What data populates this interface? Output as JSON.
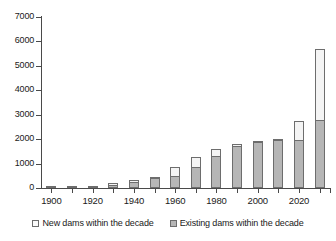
{
  "chart_data": {
    "type": "bar",
    "stacked": true,
    "title": "",
    "xlabel": "",
    "ylabel": "",
    "ylim": [
      0,
      7000
    ],
    "ytick_step": 1000,
    "yticks": [
      0,
      1000,
      2000,
      3000,
      4000,
      5000,
      6000,
      7000
    ],
    "grid": false,
    "legend_position": "bottom",
    "categories": [
      1900,
      1910,
      1920,
      1930,
      1940,
      1950,
      1960,
      1970,
      1980,
      1990,
      2000,
      2010,
      2020,
      2030
    ],
    "xtick_labels": [
      "1900",
      "",
      "1920",
      "",
      "1940",
      "",
      "1960",
      "",
      "1980",
      "",
      "2000",
      "",
      "2020",
      ""
    ],
    "series": [
      {
        "name": "Existing dams within the decade",
        "color": "#b6b6b6",
        "values": [
          10,
          15,
          40,
          120,
          230,
          390,
          500,
          880,
          1310,
          1700,
          1880,
          1970,
          1960,
          2780
        ]
      },
      {
        "name": "New dams within the decade",
        "color": "#f4f4f4",
        "values": [
          10,
          15,
          40,
          110,
          120,
          90,
          390,
          440,
          330,
          150,
          70,
          10,
          830,
          2970
        ]
      }
    ],
    "totals": [
      20,
      30,
      80,
      230,
      350,
      480,
      890,
      1320,
      1640,
      1850,
      1950,
      1980,
      2790,
      5750
    ]
  },
  "legend": {
    "items": [
      {
        "label": "New dams within the decade",
        "swatch": "new"
      },
      {
        "label": "Existing dams within the decade",
        "swatch": "existing"
      }
    ]
  },
  "colors": {
    "existing": "#b6b6b6",
    "new": "#f4f4f4",
    "axis": "#4a4a4a",
    "outline": "#6d6d6d",
    "text": "#1a1a1a",
    "background": "#ffffff"
  }
}
